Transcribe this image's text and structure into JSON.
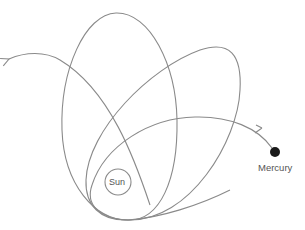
{
  "diagram": {
    "labels": {
      "sun": "Sun",
      "mercury": "Mercury"
    },
    "elements": [
      {
        "name": "orbit-1",
        "description": "Vertical elongated elliptical orbit"
      },
      {
        "name": "orbit-2",
        "description": "Orbit rotated about 40 degrees clockwise"
      },
      {
        "name": "orbit-3",
        "description": "Orbit rotated further, flatter, leading to Mercury"
      },
      {
        "name": "outgoing-path",
        "description": "Continuing orbit path with arrow pointing upper-left"
      }
    ],
    "colors": {
      "orbit_stroke": "#8a8a8a",
      "mercury_fill": "#1a1a1a",
      "background": "#ffffff"
    }
  }
}
